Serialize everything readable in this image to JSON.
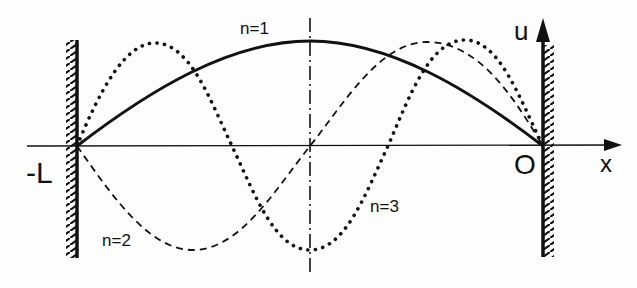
{
  "diagram": {
    "labels": {
      "left_end": "-L",
      "origin": "O",
      "x_axis": "x",
      "u_axis": "u",
      "mode1": "n=1",
      "mode2": "n=2",
      "mode3": "n=3"
    },
    "modes": [
      {
        "n": 1,
        "style": "solid"
      },
      {
        "n": 2,
        "style": "dashed"
      },
      {
        "n": 3,
        "style": "dotted"
      }
    ],
    "colors": {
      "ink": "#111111",
      "background": "#fdfdfd"
    }
  }
}
